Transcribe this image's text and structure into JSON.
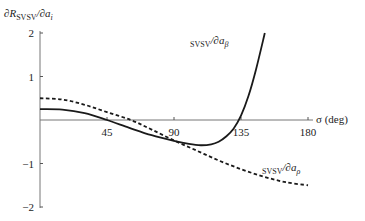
{
  "chart_data": {
    "type": "line",
    "title": "",
    "xlabel": "σ (deg)",
    "ylabel": "∂R_SVSV/∂a_i",
    "xlim": [
      0,
      180
    ],
    "ylim": [
      -2,
      2
    ],
    "x_ticks": [
      45,
      90,
      135,
      180
    ],
    "x_tick_labels": [
      "45",
      "90",
      "135",
      "180"
    ],
    "y_ticks": [
      2,
      1,
      -1,
      -2
    ],
    "y_tick_labels": [
      "2",
      "1",
      "−1",
      "−2"
    ],
    "grid": false,
    "legend": "inline-annotations",
    "series": [
      {
        "name": "∂R_SVSV/∂a_β",
        "style": "solid",
        "x": [
          0,
          15,
          30,
          45,
          60,
          75,
          90,
          100,
          108,
          115,
          120,
          125,
          130,
          135,
          140,
          145,
          151
        ],
        "y": [
          0.25,
          0.24,
          0.16,
          0.0,
          -0.18,
          -0.35,
          -0.48,
          -0.55,
          -0.58,
          -0.56,
          -0.5,
          -0.38,
          -0.2,
          0.1,
          0.55,
          1.15,
          2.0
        ]
      },
      {
        "name": "∂R_SVSV/∂a_ρ",
        "style": "dashed",
        "x": [
          0,
          15,
          30,
          45,
          61,
          75,
          90,
          105,
          120,
          135,
          150,
          165,
          180
        ],
        "y": [
          0.5,
          0.47,
          0.35,
          0.18,
          0.0,
          -0.22,
          -0.47,
          -0.7,
          -0.93,
          -1.13,
          -1.3,
          -1.43,
          -1.5
        ]
      }
    ],
    "annotations": [
      {
        "text_main": "∂R",
        "sub1": "SVSV",
        "mid": "/∂a",
        "sub2": "β",
        "target_series": 0
      },
      {
        "text_main": "∂R",
        "sub1": "SVSV",
        "mid": "/∂a",
        "sub2": "ρ",
        "target_series": 1
      }
    ],
    "ylabel_parts": {
      "main": "∂R",
      "sub1": "SVSV",
      "mid": "/∂a",
      "sub2": "i"
    }
  }
}
